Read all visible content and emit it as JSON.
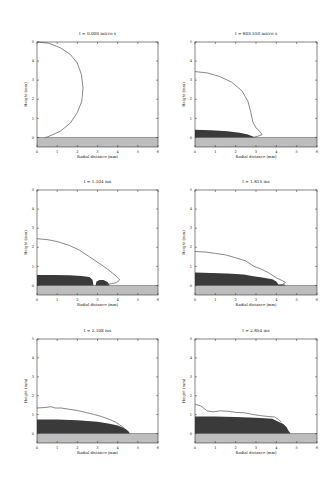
{
  "figure": {
    "xlabel": "Radial distance (mm)",
    "ylabel": "Height (mm)",
    "colors": {
      "axis": "#333333",
      "outline": "#555555",
      "substrate": "#bdbdbd",
      "splat": "#3a3a3a",
      "background": "#ffffff"
    }
  },
  "chart_data": [
    {
      "type": "line",
      "title": "t =  0.000 micro s",
      "xlabel": "Radial distance (mm)",
      "ylabel": "Height (mm)",
      "xlim": [
        0,
        6
      ],
      "ylim": [
        -0.5,
        5
      ],
      "xticks": [
        0,
        1,
        2,
        3,
        4,
        5,
        6
      ],
      "yticks": [
        0,
        1,
        2,
        3,
        4,
        5
      ],
      "box": {
        "x": 37,
        "y": 42,
        "w": 121,
        "h": 105
      },
      "droplet_outline": [
        [
          0,
          5
        ],
        [
          0.6,
          4.93
        ],
        [
          1.15,
          4.7
        ],
        [
          1.65,
          4.35
        ],
        [
          2.0,
          3.9
        ],
        [
          2.2,
          3.3
        ],
        [
          2.28,
          2.6
        ],
        [
          2.22,
          1.9
        ],
        [
          2.0,
          1.3
        ],
        [
          1.65,
          0.75
        ],
        [
          1.15,
          0.32
        ],
        [
          0.5,
          0.02
        ],
        [
          0.4,
          0.0
        ]
      ],
      "splat": []
    },
    {
      "type": "line",
      "title": "t = 603.550 micro s",
      "xlabel": "Radial distance (mm)",
      "ylabel": "Height (mm)",
      "xlim": [
        0,
        6
      ],
      "ylim": [
        -0.5,
        5
      ],
      "xticks": [
        0,
        1,
        2,
        3,
        4,
        5,
        6
      ],
      "yticks": [
        0,
        1,
        2,
        3,
        4,
        5
      ],
      "box": {
        "x": 195,
        "y": 42,
        "w": 122,
        "h": 105
      },
      "droplet_outline": [
        [
          0,
          3.45
        ],
        [
          0.6,
          3.38
        ],
        [
          1.2,
          3.2
        ],
        [
          1.8,
          2.9
        ],
        [
          2.3,
          2.45
        ],
        [
          2.6,
          1.9
        ],
        [
          2.75,
          1.3
        ],
        [
          2.85,
          0.8
        ],
        [
          3.0,
          0.5
        ],
        [
          3.2,
          0.3
        ],
        [
          3.3,
          0.15
        ],
        [
          3.05,
          0.05
        ],
        [
          2.8,
          0.0
        ]
      ],
      "splat": [
        [
          0,
          0
        ],
        [
          0,
          0.4
        ],
        [
          0.8,
          0.38
        ],
        [
          1.6,
          0.33
        ],
        [
          2.2,
          0.25
        ],
        [
          2.6,
          0.15
        ],
        [
          2.85,
          0.05
        ],
        [
          2.9,
          0
        ]
      ]
    },
    {
      "type": "line",
      "title": "t =  1.104 ms",
      "xlabel": "Radial distance (mm)",
      "ylabel": "Height (mm)",
      "xlim": [
        0,
        6
      ],
      "ylim": [
        -0.5,
        5
      ],
      "xticks": [
        0,
        1,
        2,
        3,
        4,
        5,
        6
      ],
      "yticks": [
        0,
        1,
        2,
        3,
        4,
        5
      ],
      "box": {
        "x": 37,
        "y": 190,
        "w": 121,
        "h": 105
      },
      "droplet_outline": [
        [
          0,
          2.45
        ],
        [
          0.5,
          2.4
        ],
        [
          1.0,
          2.3
        ],
        [
          1.6,
          2.1
        ],
        [
          2.1,
          1.85
        ],
        [
          2.6,
          1.5
        ],
        [
          3.1,
          1.15
        ],
        [
          3.5,
          0.85
        ],
        [
          3.8,
          0.6
        ],
        [
          4.0,
          0.42
        ],
        [
          4.1,
          0.3
        ],
        [
          3.95,
          0.15
        ],
        [
          3.7,
          0.1
        ],
        [
          3.5,
          0.05
        ],
        [
          3.4,
          0.0
        ]
      ],
      "splat": [
        [
          0,
          0
        ],
        [
          0,
          0.55
        ],
        [
          0.8,
          0.55
        ],
        [
          1.6,
          0.53
        ],
        [
          2.2,
          0.5
        ],
        [
          2.6,
          0.45
        ],
        [
          2.75,
          0.3
        ],
        [
          2.8,
          0
        ],
        [
          2.9,
          0
        ],
        [
          2.95,
          0.2
        ],
        [
          3.1,
          0.28
        ],
        [
          3.3,
          0.28
        ],
        [
          3.5,
          0.18
        ],
        [
          3.6,
          0
        ]
      ]
    },
    {
      "type": "line",
      "title": "t =  1.615 ms",
      "xlabel": "Radial distance (mm)",
      "ylabel": "Height (mm)",
      "xlim": [
        0,
        6
      ],
      "ylim": [
        -0.5,
        5
      ],
      "xticks": [
        0,
        1,
        2,
        3,
        4,
        5,
        6
      ],
      "yticks": [
        0,
        1,
        2,
        3,
        4,
        5
      ],
      "box": {
        "x": 195,
        "y": 190,
        "w": 122,
        "h": 105
      },
      "droplet_outline": [
        [
          0,
          1.78
        ],
        [
          0.5,
          1.75
        ],
        [
          1.0,
          1.68
        ],
        [
          1.5,
          1.6
        ],
        [
          2.0,
          1.45
        ],
        [
          2.5,
          1.28
        ],
        [
          2.9,
          1.0
        ],
        [
          3.2,
          0.88
        ],
        [
          3.6,
          0.68
        ],
        [
          4.0,
          0.4
        ],
        [
          4.3,
          0.25
        ],
        [
          4.45,
          0.15
        ],
        [
          4.3,
          0.05
        ],
        [
          4.1,
          0.0
        ]
      ],
      "splat": [
        [
          0,
          0
        ],
        [
          0,
          0.68
        ],
        [
          0.8,
          0.66
        ],
        [
          1.6,
          0.62
        ],
        [
          2.4,
          0.58
        ],
        [
          2.8,
          0.5
        ],
        [
          3.3,
          0.42
        ],
        [
          3.8,
          0.32
        ],
        [
          4.0,
          0.2
        ],
        [
          4.1,
          0.05
        ],
        [
          4.4,
          0.05
        ],
        [
          4.45,
          0
        ]
      ]
    },
    {
      "type": "line",
      "title": "t =  2.108 ms",
      "xlabel": "Radial distance (mm)",
      "ylabel": "Height (mm)",
      "xlim": [
        0,
        6
      ],
      "ylim": [
        -0.5,
        5
      ],
      "xticks": [
        0,
        1,
        2,
        3,
        4,
        5,
        6
      ],
      "yticks": [
        0,
        1,
        2,
        3,
        4,
        5
      ],
      "box": {
        "x": 37,
        "y": 339,
        "w": 121,
        "h": 104
      },
      "droplet_outline": [
        [
          0,
          1.35
        ],
        [
          0.4,
          1.38
        ],
        [
          0.7,
          1.42
        ],
        [
          0.9,
          1.35
        ],
        [
          1.2,
          1.35
        ],
        [
          1.6,
          1.28
        ],
        [
          2.0,
          1.22
        ],
        [
          2.4,
          1.12
        ],
        [
          2.8,
          1.02
        ],
        [
          3.2,
          0.9
        ],
        [
          3.6,
          0.75
        ],
        [
          3.9,
          0.6
        ],
        [
          4.1,
          0.45
        ],
        [
          4.25,
          0.35
        ],
        [
          4.35,
          0.25
        ]
      ],
      "splat": [
        [
          0,
          0
        ],
        [
          0,
          0.75
        ],
        [
          1.0,
          0.74
        ],
        [
          2.0,
          0.7
        ],
        [
          3.0,
          0.62
        ],
        [
          3.6,
          0.52
        ],
        [
          4.0,
          0.42
        ],
        [
          4.3,
          0.3
        ],
        [
          4.45,
          0.2
        ],
        [
          4.55,
          0.1
        ],
        [
          4.6,
          0
        ]
      ]
    },
    {
      "type": "line",
      "title": "t =  2.654 ms",
      "xlabel": "Radial distance (mm)",
      "ylabel": "Height (mm)",
      "xlim": [
        0,
        6
      ],
      "ylim": [
        -0.5,
        5
      ],
      "xticks": [
        0,
        1,
        2,
        3,
        4,
        5,
        6
      ],
      "yticks": [
        0,
        1,
        2,
        3,
        4,
        5
      ],
      "box": {
        "x": 195,
        "y": 339,
        "w": 122,
        "h": 104
      },
      "droplet_outline": [
        [
          0,
          1.55
        ],
        [
          0.3,
          1.45
        ],
        [
          0.6,
          1.2
        ],
        [
          0.9,
          1.15
        ],
        [
          1.2,
          1.2
        ],
        [
          1.6,
          1.18
        ],
        [
          2.0,
          1.12
        ],
        [
          2.4,
          1.1
        ],
        [
          2.8,
          1.02
        ],
        [
          3.2,
          0.95
        ],
        [
          3.6,
          0.9
        ],
        [
          3.9,
          0.88
        ],
        [
          4.1,
          0.75
        ],
        [
          4.25,
          0.6
        ]
      ],
      "splat": [
        [
          0,
          0
        ],
        [
          0,
          0.9
        ],
        [
          1.0,
          0.9
        ],
        [
          2.0,
          0.88
        ],
        [
          3.0,
          0.84
        ],
        [
          3.8,
          0.78
        ],
        [
          4.1,
          0.62
        ],
        [
          4.35,
          0.5
        ],
        [
          4.5,
          0.35
        ],
        [
          4.6,
          0.15
        ],
        [
          4.7,
          0
        ]
      ]
    }
  ]
}
